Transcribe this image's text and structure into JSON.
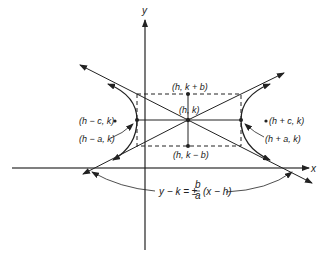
{
  "diagram": {
    "axes": {
      "x_label": "x",
      "y_label": "y"
    },
    "labels": {
      "top": "(h, k + b)",
      "center": "(h, k)",
      "bottom": "(h, k − b)",
      "left_focus": "(h − c, k)",
      "right_focus": "(h + c, k)",
      "left_vertex": "(h − a, k)",
      "right_vertex": "(h + a, k)"
    },
    "equation": {
      "lhs": "y − k = ±",
      "frac_num": "b",
      "frac_den": "a",
      "rhs": "(x − h)"
    },
    "colors": {
      "ink": "#222222",
      "background": "#ffffff"
    }
  }
}
